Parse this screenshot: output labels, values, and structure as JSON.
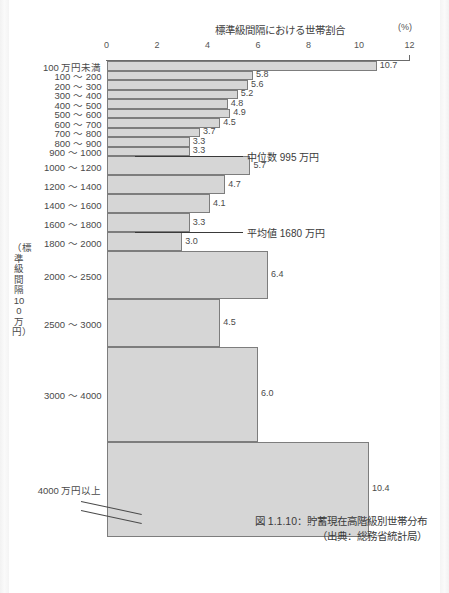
{
  "page": {
    "top_faint_text": "",
    "caption_line1": "図 1.1.10：貯蓄現在高階級別世帯分布",
    "caption_line2": "（出典：総務省統計局）"
  },
  "chart_data": {
    "type": "bar",
    "orientation": "horizontal",
    "title": "標準級間隔における世帯割合",
    "xlabel": "標準級間隔における世帯割合",
    "x_unit": "(%)",
    "ylabel": "（標準級間隔100万円）",
    "xlim": [
      0,
      12
    ],
    "xticks": [
      0,
      2,
      4,
      6,
      8,
      10,
      12
    ],
    "xtick_labels": [
      "0",
      "2",
      "4",
      "6",
      "8",
      "10",
      "12"
    ],
    "grid": false,
    "legend": "none",
    "categories": [
      "100 万円未満",
      "100 〜 200",
      "200 〜 300",
      "300 〜 400",
      "400 〜 500",
      "500 〜 600",
      "600 〜 700",
      "700 〜 800",
      "800 〜 900",
      "900 〜 1000",
      "1000 〜 1200",
      "1200 〜 1400",
      "1400 〜 1600",
      "1600 〜 1800",
      "1800 〜 2000",
      "2000 〜 2500",
      "2500 〜 3000",
      "3000 〜 4000",
      "4000 万円以上"
    ],
    "values": [
      10.7,
      5.8,
      5.6,
      5.2,
      4.8,
      4.9,
      4.5,
      3.7,
      3.3,
      3.3,
      5.7,
      4.7,
      4.1,
      3.3,
      3.0,
      6.4,
      4.5,
      6.0,
      10.4
    ],
    "value_labels": [
      "10.7",
      "5.8",
      "5.6",
      "5.2",
      "4.8",
      "4.9",
      "4.5",
      "3.7",
      "3.3",
      "3.3",
      "5.7",
      "4.7",
      "4.1",
      "3.3",
      "3.0",
      "6.4",
      "4.5",
      "6.0",
      "10.4"
    ],
    "class_widths": [
      100,
      100,
      100,
      100,
      100,
      100,
      100,
      100,
      100,
      100,
      200,
      200,
      200,
      200,
      200,
      500,
      500,
      1000,
      1000
    ],
    "annotations": [
      {
        "name": "median",
        "text": "中位数 995 万円",
        "value": 995,
        "at_category": "900 〜 1000"
      },
      {
        "name": "mean",
        "text": "平均値 1680 万円",
        "value": 1680,
        "at_category": "1600 〜 1800"
      }
    ],
    "axis_break": true,
    "colors": {
      "bar_fill": "#d6d6d6",
      "bar_border": "#7d7d7d",
      "axis": "#6b6b6b",
      "text": "#4a4a4a"
    }
  }
}
